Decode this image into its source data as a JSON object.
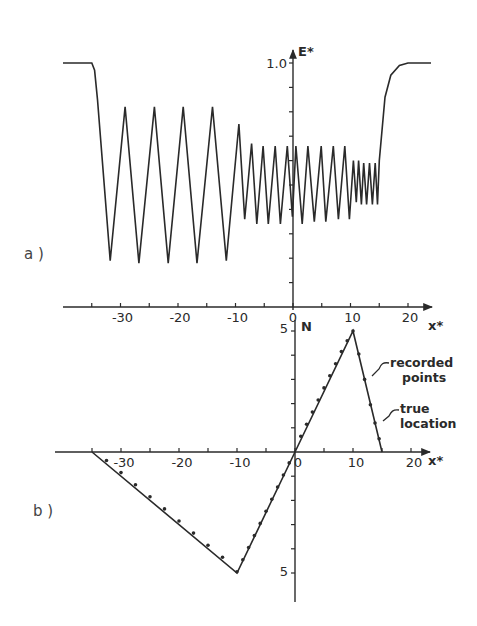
{
  "figure": {
    "panel_a_label": "a )",
    "panel_b_label": "b )",
    "colors": {
      "ink": "#2a2a2a",
      "background": "#ffffff"
    }
  },
  "chart_data": [
    {
      "id": "panel_a",
      "type": "line",
      "title": "",
      "xlabel": "x*",
      "ylabel": "E*",
      "xlim": [
        -40,
        24
      ],
      "ylim": [
        0,
        1.05
      ],
      "x_tick_labels": [
        "-30",
        "-20",
        "-10",
        "0",
        "10",
        "20"
      ],
      "x_ticks": [
        -35,
        -30,
        -25,
        -20,
        -15,
        -10,
        -5,
        0,
        5,
        10,
        15,
        20
      ],
      "y_tick_labels": [
        "1.0"
      ],
      "y_ticks": [
        0.1,
        0.2,
        0.3,
        0.4,
        0.5,
        0.6,
        0.7,
        0.8,
        0.9,
        1.0
      ],
      "grid": false,
      "legend": null,
      "series": [
        {
          "name": "E*",
          "x": [
            -40,
            -35,
            -34.5,
            -34,
            -31.8,
            -29.2,
            -26.8,
            -24.1,
            -21.7,
            -19.1,
            -16.7,
            -14,
            -11.6,
            -9.4,
            -8.4,
            -7.2,
            -6.3,
            -5.2,
            -4.3,
            -3.1,
            -2.2,
            -1,
            -0.1,
            0.5,
            1.6,
            2.6,
            3.7,
            4.9,
            5.7,
            7,
            7.9,
            9,
            9.8,
            10.5,
            11,
            11.4,
            11.9,
            12.3,
            12.8,
            13.3,
            13.8,
            14.3,
            14.7,
            15,
            16,
            17,
            18.5,
            20,
            24
          ],
          "y": [
            1.0,
            1.0,
            0.97,
            0.85,
            0.19,
            0.82,
            0.18,
            0.82,
            0.18,
            0.82,
            0.18,
            0.82,
            0.19,
            0.75,
            0.36,
            0.67,
            0.34,
            0.66,
            0.34,
            0.66,
            0.34,
            0.66,
            0.37,
            0.66,
            0.34,
            0.66,
            0.35,
            0.66,
            0.35,
            0.66,
            0.36,
            0.66,
            0.36,
            0.6,
            0.43,
            0.6,
            0.42,
            0.59,
            0.42,
            0.59,
            0.42,
            0.59,
            0.42,
            0.6,
            0.86,
            0.95,
            0.99,
            1.0,
            1.0
          ]
        }
      ]
    },
    {
      "id": "panel_b",
      "type": "line",
      "title": "",
      "xlabel": "x*",
      "ylabel": "N",
      "xlim": [
        -40,
        23
      ],
      "ylim": [
        -6,
        5.5
      ],
      "x_tick_labels": [
        "-30",
        "-20",
        "-10",
        "0",
        "10",
        "20"
      ],
      "x_ticks": [
        -35,
        -30,
        -25,
        -20,
        -15,
        -10,
        -5,
        0,
        5,
        10,
        15,
        20
      ],
      "y_tick_labels": [
        "5",
        "5"
      ],
      "y_ticks": [
        -5,
        -4,
        -3,
        -2,
        -1,
        1,
        2,
        3,
        4,
        5
      ],
      "grid": false,
      "annotations": [
        "recorded points",
        "true location"
      ],
      "series": [
        {
          "name": "true location",
          "style": "line",
          "x": [
            -35,
            -10,
            0,
            10,
            15
          ],
          "y": [
            0,
            -5,
            0,
            5,
            0
          ]
        },
        {
          "name": "recorded points",
          "style": "dots",
          "x": [
            -32.5,
            -30,
            -27.5,
            -25,
            -22.5,
            -20,
            -17.5,
            -15,
            -12.5,
            -10,
            -9,
            -8,
            -7,
            -6,
            -5,
            -4,
            -3,
            -2,
            -1,
            1,
            2,
            3,
            4,
            5,
            6,
            7,
            8,
            9,
            10,
            11,
            12,
            13,
            13.8,
            14.5
          ],
          "y": [
            -0.35,
            -0.85,
            -1.35,
            -1.85,
            -2.35,
            -2.85,
            -3.35,
            -3.85,
            -4.35,
            -4.95,
            -4.45,
            -3.95,
            -3.45,
            -2.95,
            -2.45,
            -1.95,
            -1.45,
            -0.95,
            -0.45,
            0.65,
            1.15,
            1.65,
            2.15,
            2.65,
            3.15,
            3.65,
            4.15,
            4.6,
            5.0,
            4.05,
            3.0,
            1.95,
            1.2,
            0.55
          ]
        }
      ]
    }
  ]
}
